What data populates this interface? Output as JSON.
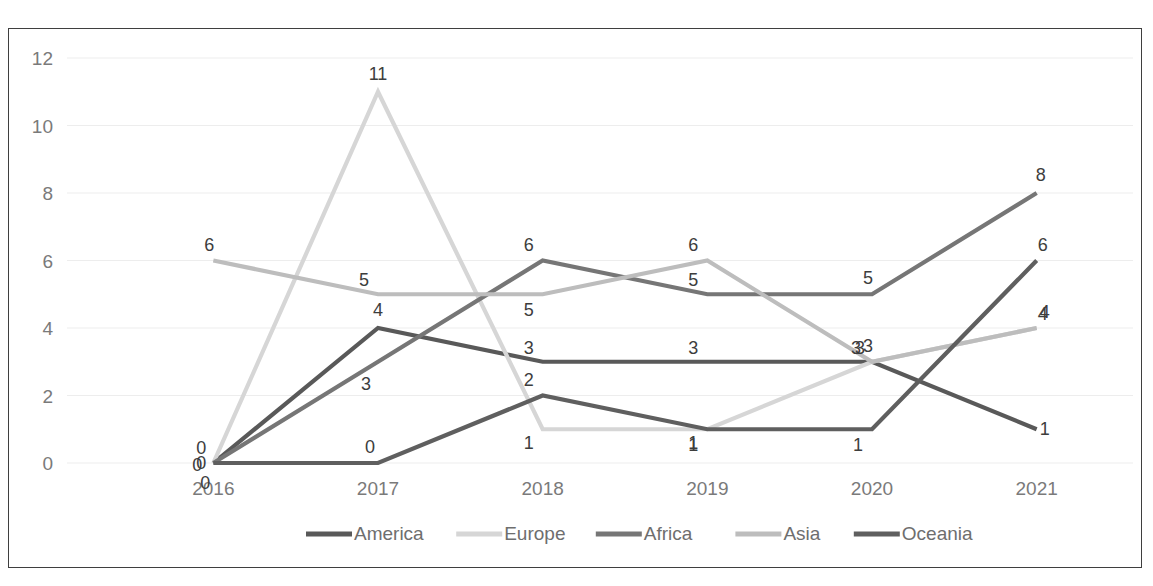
{
  "chart_data": {
    "type": "line",
    "title": "",
    "subtitle": "",
    "xlabel": "",
    "ylabel": "",
    "categories": [
      "2016",
      "2017",
      "2018",
      "2019",
      "2020",
      "2021"
    ],
    "ylim": [
      0,
      12
    ],
    "yticks": [
      "0",
      "2",
      "4",
      "6",
      "8",
      "10",
      "12"
    ],
    "grid": true,
    "legend_position": "bottom",
    "data_labels": true,
    "series": [
      {
        "name": "America",
        "color": "#595959",
        "values": [
          0,
          4,
          3,
          3,
          3,
          1
        ],
        "labels": [
          "0",
          "4",
          "3",
          "3",
          "3",
          "1"
        ]
      },
      {
        "name": "Europe",
        "color": "#d6d6d6",
        "values": [
          0,
          11,
          1,
          1,
          3,
          4
        ],
        "labels": [
          "0",
          "11",
          "1",
          "1",
          "3",
          "4"
        ]
      },
      {
        "name": "Africa",
        "color": "#767676",
        "values": [
          0,
          3,
          6,
          5,
          5,
          8
        ],
        "labels": [
          "0",
          "3",
          "6",
          "5",
          "5",
          "8"
        ]
      },
      {
        "name": "Asia",
        "color": "#bdbdbd",
        "values": [
          6,
          5,
          5,
          6,
          3,
          4
        ],
        "labels": [
          "6",
          "5",
          "5",
          "6",
          "3",
          "4"
        ]
      },
      {
        "name": "Oceania",
        "color": "#5f5f5f",
        "values": [
          0,
          0,
          2,
          1,
          1,
          6
        ],
        "labels": [
          "0",
          "0",
          "2",
          "1",
          "1",
          "6"
        ]
      }
    ]
  },
  "legend": {
    "items": [
      {
        "label": "America",
        "color": "#595959"
      },
      {
        "label": "Europe",
        "color": "#d6d6d6"
      },
      {
        "label": "Africa",
        "color": "#767676"
      },
      {
        "label": "Asia",
        "color": "#bdbdbd"
      },
      {
        "label": "Oceania",
        "color": "#5f5f5f"
      }
    ]
  },
  "style": {
    "border_color": "#3f3f3f",
    "grid_color": "#ededed",
    "tick_label_color": "#7a7a7a",
    "data_label_color": "#3d3d3d",
    "background": "#ffffff"
  }
}
